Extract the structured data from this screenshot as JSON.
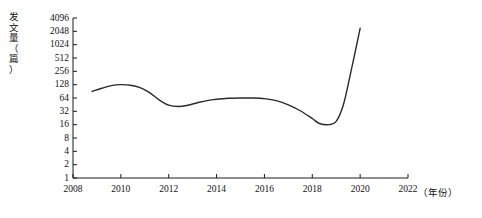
{
  "chart_data": {
    "type": "line",
    "title": "",
    "xlabel": "年份",
    "xlabel_display": "（年份）",
    "ylabel": "发文量（篇）",
    "ylabel_vertical": "发\n文\n量\n（\n篇\n）",
    "yscale": "log2",
    "ylim": [
      1,
      4096
    ],
    "xlim": [
      2008,
      2022
    ],
    "grid": false,
    "legend": false,
    "line_color": "#2a2a2a",
    "axis_color": "#1a1a1a",
    "ytick_labels": [
      "4096",
      "2048",
      "1024",
      "512",
      "256",
      "128",
      "64",
      "32",
      "16",
      "8",
      "4",
      "2",
      "1"
    ],
    "ytick_values": [
      4096,
      2048,
      1024,
      512,
      256,
      128,
      64,
      32,
      16,
      8,
      4,
      2,
      1
    ],
    "xtick_labels": [
      "2008",
      "2010",
      "2012",
      "2014",
      "2016",
      "2018",
      "2020",
      "2022"
    ],
    "xtick_values": [
      2008,
      2010,
      2012,
      2014,
      2016,
      2018,
      2020,
      2022
    ],
    "x": [
      2008.8,
      2009.2,
      2009.6,
      2010.0,
      2010.4,
      2010.8,
      2011.2,
      2011.6,
      2012.0,
      2012.4,
      2012.8,
      2013.2,
      2013.6,
      2014.0,
      2014.5,
      2015.0,
      2015.5,
      2016.0,
      2016.5,
      2017.0,
      2017.5,
      2018.0,
      2018.3,
      2018.7,
      2019.0,
      2019.3,
      2019.6,
      2020.0
    ],
    "values": [
      90,
      106,
      122,
      128,
      124,
      110,
      85,
      58,
      44,
      41,
      44,
      50,
      56,
      60,
      63,
      64,
      64,
      62,
      56,
      45,
      33,
      22,
      17,
      16,
      19,
      45,
      230,
      2400
    ],
    "series": [
      {
        "name": "发文量",
        "values": [
          90,
          106,
          122,
          128,
          124,
          110,
          85,
          58,
          44,
          41,
          44,
          50,
          56,
          60,
          63,
          64,
          64,
          62,
          56,
          45,
          33,
          22,
          17,
          16,
          19,
          45,
          230,
          2400
        ]
      }
    ],
    "annotations": []
  }
}
